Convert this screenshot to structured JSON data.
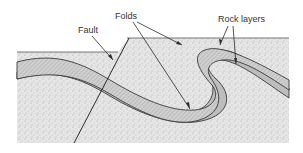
{
  "diagram": {
    "labels": {
      "fault": "Fault",
      "folds": "Folds",
      "rock_layers": "Rock layers"
    },
    "colors": {
      "background_rock": "#e4e4e4",
      "speckle": "#b8b8b8",
      "hatched_layer": "#c9c9c9",
      "gray_layer": "#bdbdbd",
      "outline": "#3a3a3a"
    }
  }
}
